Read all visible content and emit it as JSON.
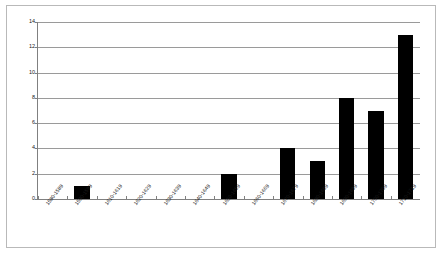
{
  "chart_data": {
    "type": "bar",
    "title": "",
    "subtitle": "",
    "xlabel": "",
    "ylabel": "",
    "ylim": [
      0,
      14
    ],
    "ytick_values": [
      0,
      2,
      4,
      6,
      8,
      10,
      12,
      14
    ],
    "ytick_labels": [
      "0",
      "2",
      "4",
      "6",
      "8",
      "10",
      "12",
      "14"
    ],
    "grid": "horizontal",
    "legend": "none",
    "bar_color": "#000000",
    "categories": [
      "1580-1589",
      "1590-1599",
      "1610-1619",
      "1620-1629",
      "1630-1639",
      "1640-1649",
      "1650-1659",
      "1660-1669",
      "1670-1679",
      "1680-1689",
      "1690-1699",
      "1700-1709",
      "1710-1719"
    ],
    "values": [
      0,
      1,
      0,
      0,
      0,
      0,
      2,
      0,
      4,
      3,
      8,
      7,
      13
    ]
  }
}
